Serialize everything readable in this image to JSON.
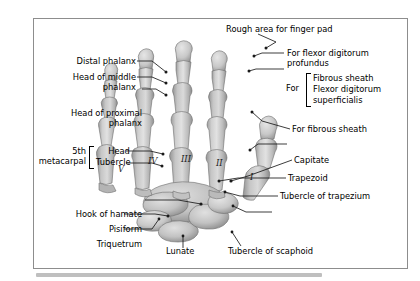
{
  "figure": {
    "kind": "anatomical-illustration",
    "frame_border_color": "#8d8d8d",
    "background_color": "#ffffff",
    "bone_fill_light": "#dcdcdc",
    "bone_fill_mid": "#b6b6b6",
    "bone_fill_dark": "#8f8f8f",
    "leader_color": "#1a1a1a"
  },
  "labels_left": [
    {
      "id": "distal-phalanx",
      "text": "Distal phalanx"
    },
    {
      "id": "head-of-middle-phalanx",
      "line1": "Head of middle",
      "line2": "phalanx"
    },
    {
      "id": "head-of-proximal-phalanx",
      "line1": "Head of proximal",
      "line2": "phalanx"
    },
    {
      "id": "fifth-metacarpal",
      "line1": "5th",
      "line2": "metacarpal"
    },
    {
      "id": "head",
      "text": "Head"
    },
    {
      "id": "tubercle",
      "text": "Tubercle"
    },
    {
      "id": "hook-of-hamate",
      "text": "Hook of hamate"
    },
    {
      "id": "pisiform",
      "text": "Pisiform"
    },
    {
      "id": "triquetrum",
      "text": "Triquetrum"
    }
  ],
  "labels_right": [
    {
      "id": "rough-area-for-finger-pad",
      "text": "Rough area for finger pad"
    },
    {
      "id": "for-flexor-digitorum-profundus",
      "line1": "For flexor digitorum",
      "line2": "profundus"
    },
    {
      "id": "for",
      "text": "For"
    },
    {
      "id": "fibrous-sheath",
      "text": "Fibrous sheath"
    },
    {
      "id": "flexor-digitorum",
      "text": "Flexor digitorum"
    },
    {
      "id": "superficialis",
      "text": "superficialis"
    },
    {
      "id": "for-fibrous-sheath",
      "text": "For fibrous sheath"
    },
    {
      "id": "capitate",
      "text": "Capitate"
    },
    {
      "id": "trapezoid",
      "text": "Trapezoid"
    },
    {
      "id": "tubercle-of-trapezium",
      "text": "Tubercle of trapezium"
    }
  ],
  "labels_bottom": [
    {
      "id": "lunate",
      "text": "Lunate"
    },
    {
      "id": "tubercle-of-scaphoid",
      "text": "Tubercle of scaphoid"
    }
  ],
  "metacarpal_numerals": [
    {
      "id": "numeral-five",
      "text": "V"
    },
    {
      "id": "numeral-four",
      "text": "IV"
    },
    {
      "id": "numeral-three",
      "text": "III"
    },
    {
      "id": "numeral-two",
      "text": "II"
    },
    {
      "id": "numeral-one",
      "text": "I"
    }
  ]
}
